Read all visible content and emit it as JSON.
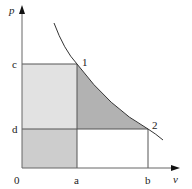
{
  "diagram": {
    "type": "p-v diagram",
    "axes": {
      "y_label": "p",
      "x_label": "v",
      "origin_label": "0"
    },
    "tick_labels": {
      "c": "c",
      "d": "d",
      "a": "a",
      "b": "b"
    },
    "points": {
      "p1": "1",
      "p2": "2"
    },
    "colors": {
      "light_region": "#e3e3e3",
      "dotted_region": "#cfcfcf",
      "dark_region": "#b4b4b4",
      "lines": "#555555",
      "curve": "#333333"
    }
  }
}
